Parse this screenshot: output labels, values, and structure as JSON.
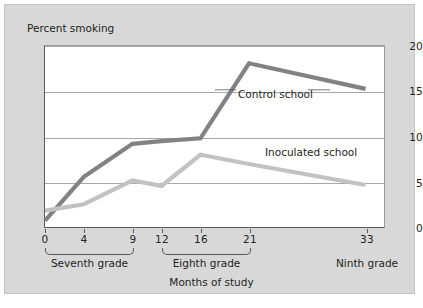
{
  "figure": {
    "background_color": "#d8d8d8",
    "plot_background_color": "#ffffff"
  },
  "chart_data": {
    "type": "line",
    "title": "",
    "xlabel": "Months of study",
    "ylabel": "Percent smoking",
    "xlim": [
      0,
      35
    ],
    "ylim": [
      0,
      20
    ],
    "yticks": [
      0,
      5,
      10,
      15,
      20
    ],
    "ytick_labels": [
      "0",
      "5",
      "10",
      "15",
      "20"
    ],
    "xticks": [
      0,
      4,
      9,
      12,
      16,
      21,
      33
    ],
    "xtick_labels": [
      "0",
      "4",
      "9",
      "12",
      "16",
      "21",
      "33"
    ],
    "grid": "horizontal",
    "legend": "inline-annotations",
    "x": [
      0,
      4,
      9,
      12,
      16,
      21,
      33
    ],
    "series": [
      {
        "name": "Control school",
        "color": "#808285",
        "values": [
          0.8,
          5.6,
          9.2,
          9.5,
          9.8,
          18.0,
          15.2
        ]
      },
      {
        "name": "Inoculated school",
        "color": "#c0c2c4",
        "values": [
          1.9,
          2.6,
          5.2,
          4.6,
          8.0,
          7.0,
          4.7
        ]
      }
    ],
    "annotations": [
      {
        "text": "Control school",
        "x": 21,
        "y": 15.1
      },
      {
        "text": "Inoculated school",
        "x": 24,
        "y": 7.2
      }
    ],
    "x_groups": [
      {
        "label": "Seventh grade",
        "ticks": [
          "0",
          "4",
          "9"
        ]
      },
      {
        "label": "Eighth grade",
        "ticks": [
          "12",
          "16",
          "21"
        ]
      },
      {
        "label": "Ninth grade",
        "ticks": [
          "33"
        ]
      }
    ]
  }
}
